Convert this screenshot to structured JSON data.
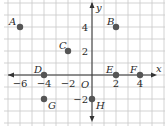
{
  "chart_data": {
    "type": "scatter",
    "title": "",
    "xlabel": "x",
    "ylabel": "y",
    "origin_label": "O",
    "xlim": [
      -7.5,
      6
    ],
    "ylim": [
      -4,
      6
    ],
    "grid": true,
    "grid_step": 1,
    "x_ticks": [
      {
        "value": -6,
        "label": "−6"
      },
      {
        "value": -4,
        "label": "−4"
      },
      {
        "value": -2,
        "label": "−2"
      },
      {
        "value": 2,
        "label": "2"
      },
      {
        "value": 4,
        "label": "4"
      }
    ],
    "y_ticks": [
      {
        "value": 4,
        "label": "4"
      },
      {
        "value": 2,
        "label": "2"
      },
      {
        "value": -2,
        "label": "−2"
      }
    ],
    "points": [
      {
        "name": "A",
        "x": -6,
        "y": 4
      },
      {
        "name": "B",
        "x": 2,
        "y": 4
      },
      {
        "name": "C",
        "x": -2,
        "y": 2
      },
      {
        "name": "D",
        "x": -4,
        "y": 0
      },
      {
        "name": "E",
        "x": 2,
        "y": 0
      },
      {
        "name": "F",
        "x": 4,
        "y": 0
      },
      {
        "name": "G",
        "x": -4,
        "y": -2
      },
      {
        "name": "H",
        "x": 0,
        "y": -2
      }
    ],
    "colors": {
      "grid": "#c8c8c8",
      "axis": "#333333",
      "point": "#555555"
    }
  }
}
